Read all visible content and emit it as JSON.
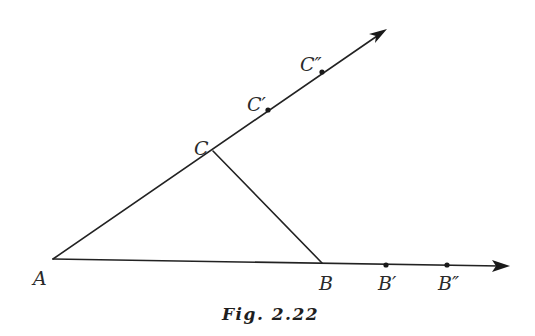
{
  "figure": {
    "caption": "Fig. 2.22",
    "colors": {
      "ink": "#222222",
      "background": "#ffffff"
    },
    "points": {
      "A": {
        "label": "A",
        "x": 53,
        "y": 259
      },
      "B": {
        "label": "B",
        "x": 322,
        "y": 263
      },
      "B1": {
        "label": "B′",
        "x": 386,
        "y": 265
      },
      "B2": {
        "label": "B″",
        "x": 447,
        "y": 265
      },
      "C": {
        "label": "C",
        "x": 213,
        "y": 151
      },
      "C1": {
        "label": "C′",
        "x": 268,
        "y": 110
      },
      "C2": {
        "label": "C″",
        "x": 322,
        "y": 72
      }
    },
    "rays": [
      {
        "name": "ray-AB",
        "from": "A",
        "through": [
          "B",
          "B′",
          "B″"
        ],
        "tip": {
          "x": 509,
          "y": 266
        }
      },
      {
        "name": "ray-AC",
        "from": "A",
        "through": [
          "C",
          "C′",
          "C″"
        ],
        "tip": {
          "x": 387,
          "y": 29
        }
      }
    ],
    "segments": [
      {
        "name": "segment-CB",
        "from": "C",
        "to": "B"
      }
    ]
  }
}
